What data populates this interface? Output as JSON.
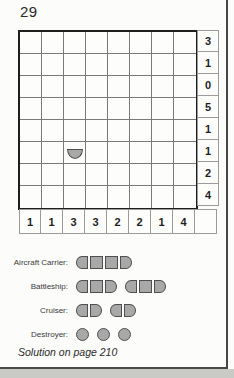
{
  "page": {
    "puzzle_number": "29",
    "solution_note": "Solution on page 210"
  },
  "board": {
    "rows": 8,
    "cols": 8,
    "right_clues": [
      "3",
      "1",
      "0",
      "5",
      "1",
      "1",
      "2",
      "4"
    ],
    "bottom_clues": [
      "1",
      "1",
      "3",
      "3",
      "2",
      "2",
      "1",
      "4"
    ],
    "pieces": [
      {
        "row": 6,
        "col": 3,
        "type": "ship-bottom-end"
      }
    ]
  },
  "legend": {
    "items": [
      {
        "label": "Aircraft Carrier:",
        "ships": [
          [
            "cap-left",
            "mid",
            "mid",
            "cap-right"
          ]
        ]
      },
      {
        "label": "Battleship:",
        "ships": [
          [
            "cap-left",
            "mid",
            "cap-right"
          ],
          [
            "cap-left",
            "mid",
            "cap-right"
          ]
        ]
      },
      {
        "label": "Cruiser:",
        "ships": [
          [
            "cap-left",
            "cap-right"
          ],
          [
            "cap-left",
            "cap-right"
          ]
        ]
      },
      {
        "label": "Destroyer:",
        "ships": [
          [
            "circle"
          ],
          [
            "circle"
          ],
          [
            "circle"
          ]
        ]
      }
    ]
  },
  "colors": {
    "page_bg": "#fcfcfa",
    "grid_border": "#1e1e1e",
    "grid_line": "#7a7a7a",
    "clue_border": "#9b9b9b",
    "clue_text": "#1f1f1f",
    "ship_fill": "#a8a8a8",
    "ship_stroke": "#4f4f4f",
    "frame_line": "#474747",
    "shadow_band": "#c9c9c6"
  }
}
